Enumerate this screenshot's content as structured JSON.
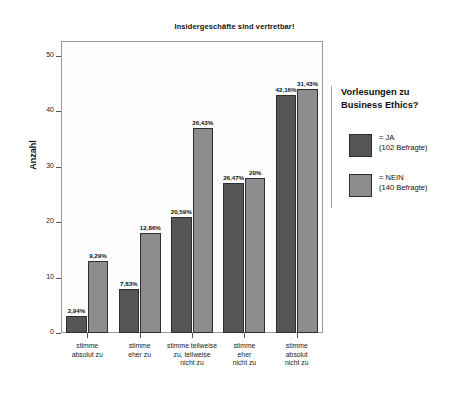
{
  "chart_data": {
    "type": "bar",
    "title": "Insidergeschäfte sind vertretbar!",
    "xlabel": "",
    "ylabel": "Anzahl",
    "ylim": [
      0,
      50
    ],
    "yticks": [
      0,
      10,
      20,
      30,
      40,
      50
    ],
    "ytick_labels": [
      "0",
      "10",
      "20",
      "30",
      "40",
      "50"
    ],
    "grid": false,
    "legend_position": "right",
    "categories": [
      "stimme\nabsolut zu",
      "stimme\neher zu",
      "stimme teilweise\nzu, teilweise\nnicht zu",
      "stimme\neher\nnicht zu",
      "stimme\nabsolut\nnicht zu"
    ],
    "series": [
      {
        "name": "= JA",
        "respondents_label": "(102 Befragte)",
        "color": "#555555",
        "values": [
          3,
          8,
          21,
          27,
          43
        ],
        "labels": [
          "2,94%",
          "7,83%",
          "20,59%",
          "26,47%",
          "42,16%"
        ]
      },
      {
        "name": "= NEIN",
        "respondents_label": "(140 Befragte)",
        "color": "#8d8d8d",
        "values": [
          13,
          18,
          37,
          28,
          44
        ],
        "labels": [
          "9,29%",
          "12,86%",
          "26,43%",
          "20%",
          "31,43%"
        ]
      }
    ]
  },
  "legend": {
    "title": "Vorlesungen zu\nBusiness Ethics?",
    "rows": [
      {
        "name": "= JA",
        "sub": "(102 Befragte)"
      },
      {
        "name": "= NEIN",
        "sub": "(140 Befragte)"
      }
    ]
  }
}
